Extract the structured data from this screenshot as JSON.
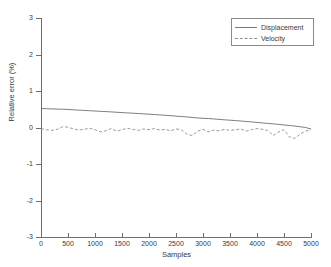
{
  "chart_data": {
    "type": "line",
    "title": "",
    "xlabel": "Samples",
    "ylabel": "Relative error (%)",
    "xlim": [
      0,
      5000
    ],
    "ylim": [
      -3,
      3
    ],
    "xticks": [
      0,
      500,
      1000,
      1500,
      2000,
      2500,
      3000,
      3500,
      4000,
      4500,
      5000
    ],
    "yticks": [
      -3,
      -2,
      -1,
      0,
      1,
      2,
      3
    ],
    "xtick_labels": [
      "0",
      "500",
      "1000",
      "1500",
      "2000",
      "2500",
      "3000",
      "3500",
      "4000",
      "4500",
      "5000"
    ],
    "ytick_labels": [
      "-3",
      "-2",
      "-1",
      "0",
      "1",
      "2",
      "3"
    ],
    "grid": false,
    "legend_position": "upper right",
    "series": [
      {
        "name": "Displacement",
        "style": "solid",
        "color": "#6e6e6e",
        "x": [
          0,
          100,
          200,
          300,
          400,
          500,
          600,
          700,
          800,
          900,
          1000,
          1100,
          1200,
          1300,
          1400,
          1500,
          1600,
          1700,
          1800,
          1900,
          2000,
          2100,
          2200,
          2300,
          2400,
          2500,
          2600,
          2700,
          2800,
          2900,
          3000,
          3100,
          3200,
          3300,
          3400,
          3500,
          3600,
          3700,
          3800,
          3900,
          4000,
          4100,
          4200,
          4300,
          4400,
          4500,
          4600,
          4700,
          4800,
          4900,
          5000
        ],
        "values": [
          0.52,
          0.515,
          0.51,
          0.505,
          0.5,
          0.495,
          0.485,
          0.475,
          0.468,
          0.46,
          0.452,
          0.443,
          0.435,
          0.427,
          0.418,
          0.408,
          0.4,
          0.392,
          0.383,
          0.374,
          0.365,
          0.355,
          0.345,
          0.335,
          0.325,
          0.312,
          0.3,
          0.29,
          0.275,
          0.262,
          0.252,
          0.245,
          0.235,
          0.222,
          0.21,
          0.2,
          0.19,
          0.178,
          0.165,
          0.152,
          0.14,
          0.125,
          0.112,
          0.1,
          0.085,
          0.07,
          0.055,
          0.04,
          0.02,
          0.0,
          -0.04
        ]
      },
      {
        "name": "Velocity",
        "style": "dashed",
        "color": "#8f8f8f",
        "x": [
          0,
          100,
          200,
          300,
          400,
          500,
          600,
          700,
          800,
          900,
          1000,
          1100,
          1200,
          1300,
          1400,
          1500,
          1600,
          1700,
          1800,
          1900,
          2000,
          2100,
          2200,
          2300,
          2400,
          2500,
          2600,
          2700,
          2800,
          2900,
          3000,
          3100,
          3200,
          3300,
          3400,
          3500,
          3600,
          3700,
          3800,
          3900,
          4000,
          4100,
          4200,
          4300,
          4400,
          4500,
          4600,
          4700,
          4800,
          4900,
          5000
        ],
        "values": [
          -0.03,
          -0.06,
          -0.08,
          -0.05,
          0.02,
          0.01,
          -0.04,
          -0.07,
          -0.05,
          -0.02,
          -0.06,
          -0.12,
          -0.09,
          -0.03,
          -0.1,
          -0.06,
          -0.02,
          -0.05,
          -0.08,
          -0.04,
          -0.06,
          -0.03,
          -0.07,
          -0.05,
          -0.09,
          -0.04,
          -0.06,
          -0.18,
          -0.22,
          -0.1,
          -0.05,
          -0.12,
          -0.07,
          -0.09,
          -0.05,
          -0.08,
          -0.06,
          -0.04,
          -0.1,
          -0.06,
          -0.03,
          -0.05,
          -0.08,
          -0.22,
          -0.12,
          -0.06,
          -0.26,
          -0.3,
          -0.18,
          -0.1,
          -0.06
        ]
      }
    ]
  },
  "legend": {
    "items": [
      {
        "label": "Displacement"
      },
      {
        "label": "Velocity"
      }
    ]
  }
}
